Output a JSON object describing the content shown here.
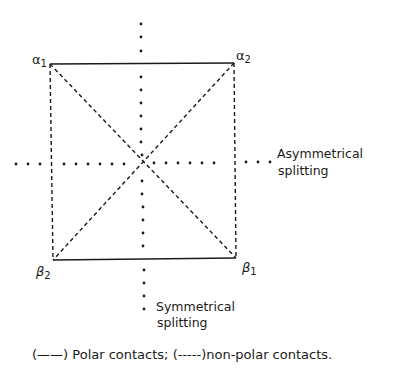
{
  "diagram": {
    "type": "contact-square",
    "nodes": [
      {
        "id": "alpha1",
        "greek": "α",
        "sub": "1",
        "x": 50,
        "y": 64
      },
      {
        "id": "alpha2",
        "greek": "α",
        "sub": "2",
        "x": 234,
        "y": 63
      },
      {
        "id": "beta1",
        "greek": "β",
        "sub": "1",
        "x": 236,
        "y": 258
      },
      {
        "id": "beta2",
        "greek": "β",
        "sub": "2",
        "x": 53,
        "y": 260
      }
    ],
    "edges": [
      {
        "from": "alpha1",
        "to": "alpha2",
        "style": "solid",
        "meaning": "polar"
      },
      {
        "from": "beta2",
        "to": "beta1",
        "style": "solid",
        "meaning": "polar"
      },
      {
        "from": "alpha1",
        "to": "beta2",
        "style": "dashed",
        "meaning": "non-polar"
      },
      {
        "from": "alpha2",
        "to": "beta1",
        "style": "dashed",
        "meaning": "non-polar"
      },
      {
        "from": "alpha1",
        "to": "beta1",
        "style": "dashed",
        "meaning": "non-polar"
      },
      {
        "from": "alpha2",
        "to": "beta2",
        "style": "dashed",
        "meaning": "non-polar"
      }
    ],
    "axes": {
      "vertical": {
        "label_line1": "Symmetrical",
        "label_line2": "splitting",
        "style": "dotted"
      },
      "horizontal": {
        "label_line1": "Asymmetrical",
        "label_line2": "splitting",
        "style": "dotted"
      }
    }
  },
  "labels": {
    "alpha": "α",
    "beta": "β",
    "sub1": "1",
    "sub2": "2",
    "asym_line1": "Asymmetrical",
    "asym_line2": "splitting",
    "sym_line1": "Symmetrical",
    "sym_line2": "splitting"
  },
  "legend": {
    "polar_key": "(——)",
    "polar_text": "Polar contacts;",
    "nonpolar_key": "(-----)",
    "nonpolar_text": "non-polar contacts."
  },
  "colors": {
    "ink": "#1a1a1a",
    "background": "#ffffff"
  }
}
